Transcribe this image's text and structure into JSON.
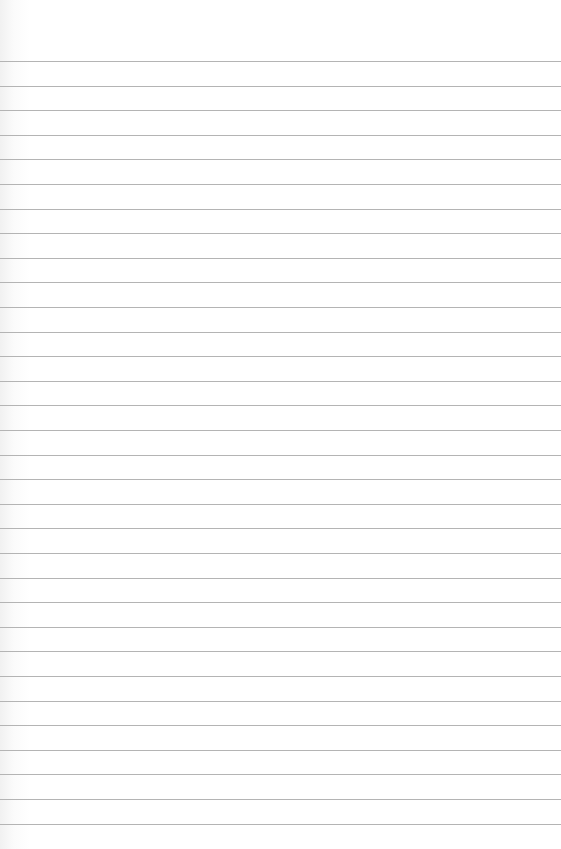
{
  "page": {
    "type": "lined-paper",
    "background_color": "#ffffff",
    "rule_color": "#b4b4b4",
    "header_bleedthrough_text": "",
    "rules": {
      "count": 32,
      "first_y": 61,
      "spacing": 24.6
    }
  }
}
